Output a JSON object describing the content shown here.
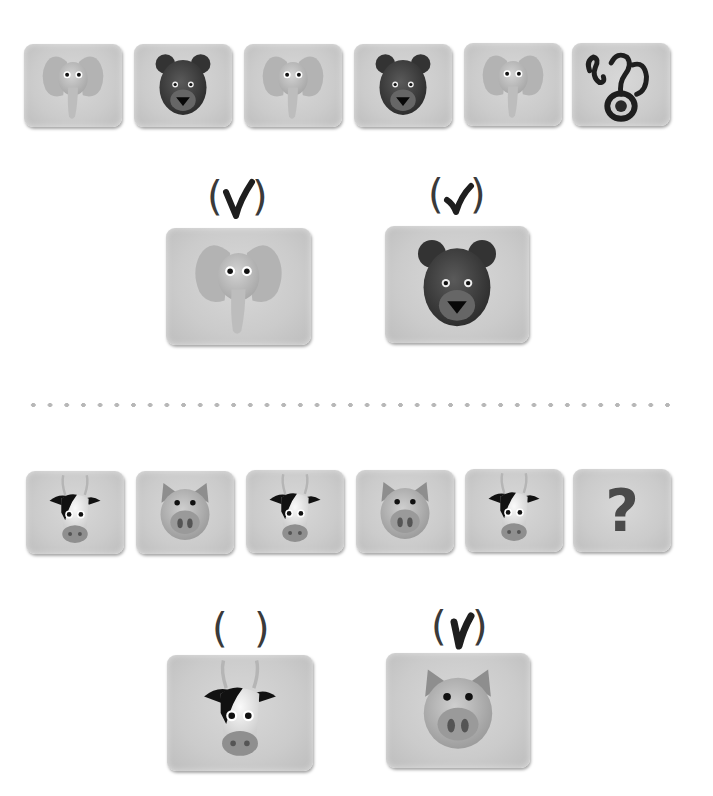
{
  "worksheet": {
    "section1": {
      "sequence": [
        {
          "animal": "elephant"
        },
        {
          "animal": "bear"
        },
        {
          "animal": "elephant"
        },
        {
          "animal": "bear"
        },
        {
          "animal": "elephant"
        },
        {
          "animal": "unknown",
          "label": "?",
          "note": "scribbled handwritten question mark"
        }
      ],
      "options": [
        {
          "animal": "elephant",
          "open_paren": "(",
          "close_paren": ")",
          "mark": "✓",
          "checked": true
        },
        {
          "animal": "bear",
          "open_paren": "(",
          "close_paren": ")",
          "mark": "✓",
          "checked": true
        }
      ]
    },
    "divider": {
      "style": "dotted"
    },
    "section2": {
      "sequence": [
        {
          "animal": "cow"
        },
        {
          "animal": "pig"
        },
        {
          "animal": "cow"
        },
        {
          "animal": "pig"
        },
        {
          "animal": "cow"
        },
        {
          "animal": "unknown",
          "label": "?"
        }
      ],
      "options": [
        {
          "animal": "cow",
          "open_paren": "(",
          "close_paren": ")",
          "mark": "",
          "checked": false
        },
        {
          "animal": "pig",
          "open_paren": "(",
          "close_paren": ")",
          "mark": "✓",
          "checked": true
        }
      ]
    },
    "colors": {
      "card": "#cbcbcb",
      "ink": "#1e1e1e",
      "paren": "#3a3a3a",
      "dots": "#b7b7b7"
    }
  }
}
